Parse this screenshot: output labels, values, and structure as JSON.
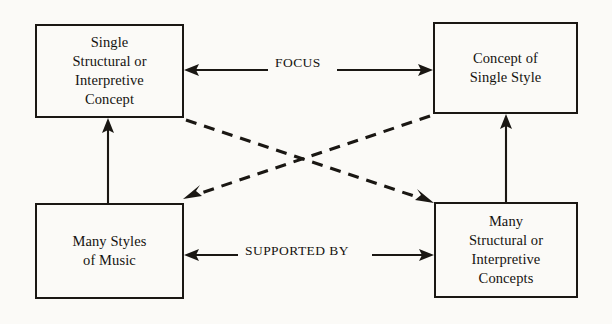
{
  "diagram": {
    "type": "block-flow-diagram",
    "background_color": "#fbfaf7",
    "line_color": "#1a1713",
    "boxes": [
      {
        "id": "top-left",
        "name": "single-structural-or-interpretive-concept",
        "text": "Single\nStructural or\nInterpretive\nConcept"
      },
      {
        "id": "top-right",
        "name": "concept-of-single-style",
        "text": "Concept of\nSingle Style"
      },
      {
        "id": "bottom-left",
        "name": "many-styles-of-music",
        "text": "Many Styles\nof Music"
      },
      {
        "id": "bottom-right",
        "name": "many-structural-or-interpretive-concepts",
        "text": "Many\nStructural or\nInterpretive\nConcepts"
      }
    ],
    "connections": [
      {
        "id": "focus",
        "label": "FOCUS",
        "from": "top-left",
        "to": "top-right",
        "style": "solid",
        "arrows": "both"
      },
      {
        "id": "supported-by",
        "label": "SUPPORTED BY",
        "from": "bottom-left",
        "to": "bottom-right",
        "style": "solid",
        "arrows": "both"
      },
      {
        "id": "left-vertical",
        "label": "",
        "from": "bottom-left",
        "to": "top-left",
        "style": "solid",
        "arrows": "up"
      },
      {
        "id": "right-vertical",
        "label": "",
        "from": "bottom-right",
        "to": "top-right",
        "style": "solid",
        "arrows": "up"
      },
      {
        "id": "diagonal-tl-to-br",
        "label": "",
        "from": "top-left",
        "to": "bottom-right",
        "style": "dashed",
        "arrows": "to"
      },
      {
        "id": "diagonal-tr-to-bl",
        "label": "",
        "from": "top-right",
        "to": "bottom-left",
        "style": "dashed",
        "arrows": "to"
      }
    ]
  }
}
